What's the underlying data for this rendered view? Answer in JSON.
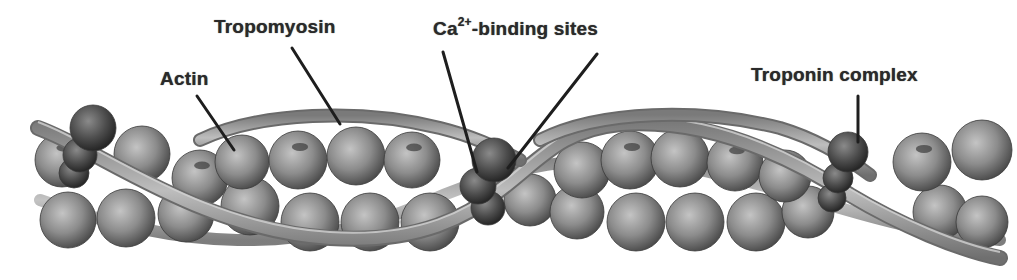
{
  "diagram": {
    "labels": {
      "actin": "Actin",
      "tropomyosin": "Tropomyosin",
      "calcium_prefix": "Ca",
      "calcium_superscript": "2+",
      "calcium_suffix": "-binding sites",
      "troponin": "Troponin complex"
    },
    "label_positions": {
      "actin": {
        "x": 160,
        "y": 68
      },
      "tropomyosin": {
        "x": 214,
        "y": 16
      },
      "calcium": {
        "x": 433,
        "y": 17
      },
      "troponin": {
        "x": 751,
        "y": 64
      }
    },
    "leader_lines": [
      {
        "name": "actin-leader",
        "x1": 197,
        "y1": 96,
        "x2": 234,
        "y2": 150
      },
      {
        "name": "tropomyosin-leader",
        "x1": 292,
        "y1": 48,
        "x2": 340,
        "y2": 124
      },
      {
        "name": "calcium-leader-1",
        "x1": 443,
        "y1": 52,
        "x2": 477,
        "y2": 172
      },
      {
        "name": "calcium-leader-2",
        "x1": 597,
        "y1": 54,
        "x2": 508,
        "y2": 168
      },
      {
        "name": "troponin-leader",
        "x1": 858,
        "y1": 96,
        "x2": 858,
        "y2": 142
      }
    ],
    "colors": {
      "actin_fill": "#8c8c8c",
      "actin_highlight": "#c4c4c4",
      "actin_shadow": "#4a4a4a",
      "tropomyosin": "#a8a8a8",
      "tropomyosin_edge": "#6a6a6a",
      "troponin_fill": "#4c4c4c",
      "troponin_highlight": "#8a8a8a",
      "leader": "#1e1e1e",
      "text": "#2a2a2a"
    },
    "actin_top_row": [
      {
        "x": 62,
        "y": 160,
        "r": 27
      },
      {
        "x": 142,
        "y": 154,
        "r": 28
      },
      {
        "x": 200,
        "y": 178,
        "r": 28
      },
      {
        "x": 242,
        "y": 162,
        "r": 27
      },
      {
        "x": 298,
        "y": 160,
        "r": 29
      },
      {
        "x": 356,
        "y": 156,
        "r": 29
      },
      {
        "x": 412,
        "y": 160,
        "r": 28
      },
      {
        "x": 582,
        "y": 170,
        "r": 28
      },
      {
        "x": 630,
        "y": 160,
        "r": 29
      },
      {
        "x": 680,
        "y": 158,
        "r": 29
      },
      {
        "x": 735,
        "y": 163,
        "r": 28
      },
      {
        "x": 785,
        "y": 176,
        "r": 26
      },
      {
        "x": 922,
        "y": 162,
        "r": 29
      },
      {
        "x": 982,
        "y": 150,
        "r": 30
      }
    ],
    "actin_bottom_row": [
      {
        "x": 68,
        "y": 220,
        "r": 28
      },
      {
        "x": 126,
        "y": 218,
        "r": 29
      },
      {
        "x": 186,
        "y": 214,
        "r": 28
      },
      {
        "x": 250,
        "y": 206,
        "r": 29
      },
      {
        "x": 310,
        "y": 222,
        "r": 29
      },
      {
        "x": 370,
        "y": 222,
        "r": 29
      },
      {
        "x": 430,
        "y": 222,
        "r": 29
      },
      {
        "x": 530,
        "y": 200,
        "r": 26
      },
      {
        "x": 577,
        "y": 212,
        "r": 27
      },
      {
        "x": 636,
        "y": 222,
        "r": 29
      },
      {
        "x": 695,
        "y": 222,
        "r": 29
      },
      {
        "x": 756,
        "y": 222,
        "r": 29
      },
      {
        "x": 808,
        "y": 212,
        "r": 26
      },
      {
        "x": 940,
        "y": 212,
        "r": 27
      },
      {
        "x": 982,
        "y": 222,
        "r": 26
      }
    ],
    "troponin_complexes": [
      {
        "name": "troponin-left",
        "balls": [
          {
            "x": 93,
            "y": 128,
            "r": 23
          },
          {
            "x": 80,
            "y": 155,
            "r": 17
          },
          {
            "x": 74,
            "y": 173,
            "r": 15
          }
        ]
      },
      {
        "name": "troponin-middle",
        "balls": [
          {
            "x": 494,
            "y": 160,
            "r": 22
          },
          {
            "x": 478,
            "y": 186,
            "r": 18
          },
          {
            "x": 488,
            "y": 208,
            "r": 17
          }
        ]
      },
      {
        "name": "troponin-right",
        "balls": [
          {
            "x": 848,
            "y": 152,
            "r": 20
          },
          {
            "x": 838,
            "y": 178,
            "r": 15
          },
          {
            "x": 832,
            "y": 198,
            "r": 14
          }
        ]
      }
    ]
  }
}
